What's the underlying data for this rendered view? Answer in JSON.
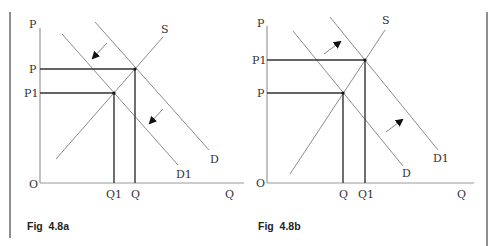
{
  "figures": [
    {
      "caption": "Fig  4.8a",
      "axes": {
        "y_label": "P",
        "x_label": "Q",
        "origin": "O"
      },
      "price_labels": {
        "upper": "P",
        "lower": "P1"
      },
      "quantity_labels": {
        "left": "Q1",
        "right": "Q"
      },
      "curve_labels": {
        "supply": "S",
        "demand_original": "D",
        "demand_shifted": "D1"
      },
      "shift_direction": "left (decrease in demand)"
    },
    {
      "caption": "Fig  4.8b",
      "axes": {
        "y_label": "P",
        "x_label": "Q",
        "origin": "O"
      },
      "price_labels": {
        "upper": "P1",
        "lower": "P"
      },
      "quantity_labels": {
        "left": "Q",
        "right": "Q1"
      },
      "curve_labels": {
        "supply": "S",
        "demand_original": "D",
        "demand_shifted": "D1"
      },
      "shift_direction": "right (increase in demand)"
    }
  ],
  "colors": {
    "axis": "#9a9a9a",
    "curve": "#8c8c8c",
    "guide": "#333333",
    "text": "#333333"
  }
}
